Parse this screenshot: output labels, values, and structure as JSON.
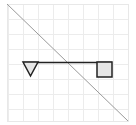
{
  "diagram": {
    "frame": {
      "x": 7,
      "y": 4,
      "width": 121,
      "height": 117,
      "stroke": "#e8e8e8"
    },
    "grid": {
      "spacing": 15,
      "color": "#ececec",
      "vertical_x": [
        8,
        23,
        38,
        53,
        68,
        83,
        98,
        113,
        128
      ],
      "horizontal_y": [
        4,
        19,
        34,
        49,
        64,
        79,
        94,
        109,
        121
      ]
    },
    "diagonal": {
      "x1": 7,
      "y1": 4,
      "x2": 128,
      "y2": 121,
      "stroke": "#9a9a9a"
    },
    "beam": {
      "x1": 23,
      "y1": 62,
      "x2": 112,
      "y2": 62,
      "stroke": "#222222"
    },
    "triangle": {
      "points": "23,62 38,62 30.5,76",
      "fill": "#e6e6e6",
      "stroke": "#222222"
    },
    "square": {
      "x": 97,
      "y": 62,
      "width": 15,
      "height": 15,
      "fill": "#e6e6e6",
      "stroke": "#222222"
    }
  }
}
